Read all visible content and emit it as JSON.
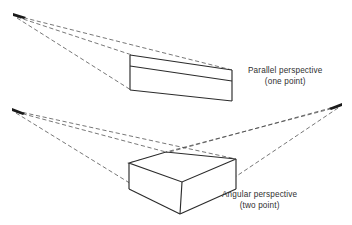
{
  "figure": {
    "background_color": "#ffffff",
    "line_color": "#2b2b2b",
    "guide_color": "#4a4a4a",
    "text_color": "#303030"
  },
  "diagrams": [
    {
      "id": "parallel-perspective",
      "caption_line1": "Parallel perspective",
      "caption_line2": "(one point)",
      "vanishing_points": [
        {
          "name": "single-vanishing-point",
          "x": 16,
          "y": 15
        }
      ],
      "box": {
        "type": "rectangular-prism",
        "front_face": {
          "left": 130,
          "top": 66,
          "right": 232,
          "bottom": 101
        },
        "depth_offset": {
          "dx": -100,
          "dy": -12
        }
      },
      "guide_lines": 3
    },
    {
      "id": "angular-perspective",
      "caption_line1": "Angular perspective",
      "caption_line2": "(two point)",
      "vanishing_points": [
        {
          "name": "left-vanishing-point",
          "x": 15,
          "y": 110
        },
        {
          "name": "right-vanishing-point",
          "x": 339,
          "y": 105
        }
      ],
      "box": {
        "type": "rectangular-prism-rotated",
        "near_bottom_corner": {
          "x": 180,
          "y": 214
        },
        "left_corner": {
          "x": 129,
          "y": 163
        },
        "right_corner": {
          "x": 236,
          "y": 159
        },
        "far_top_corner": {
          "x": 166,
          "y": 152
        }
      },
      "guide_lines": 6
    }
  ]
}
